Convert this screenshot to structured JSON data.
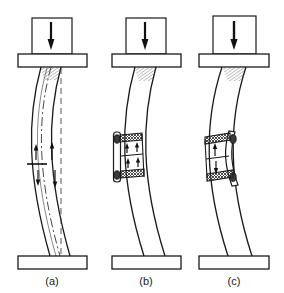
{
  "figure": {
    "background_color": "#ffffff",
    "line_color": "#1a1a1a",
    "fill_color": "#ffffff",
    "hatch_color": "#555555",
    "panel_count": 3
  },
  "panels": [
    {
      "id": "a",
      "caption": "(a)",
      "description": "Buckled column under axial load, unrepaired",
      "load_arrow": "down-arrow",
      "load_block": "load-block",
      "top_plate": "top-base-plate",
      "bottom_plate": "bottom-base-plate",
      "weld_hatch_top": true,
      "centerline_curved": true,
      "centerline_straight_dashed": true,
      "splice_plate": false,
      "arrows": [
        {
          "id": "a-arrow-1",
          "direction": "up",
          "side": "left",
          "row": "upper"
        },
        {
          "id": "a-arrow-2",
          "direction": "up",
          "side": "right",
          "row": "upper"
        },
        {
          "id": "a-arrow-3",
          "direction": "down",
          "side": "left",
          "row": "lower"
        },
        {
          "id": "a-arrow-4",
          "direction": "down",
          "side": "right",
          "row": "lower"
        }
      ],
      "section_tick": true,
      "arrow_count": 4
    },
    {
      "id": "b",
      "caption": "(b)",
      "description": "Symmetric splice plate with bolts on concave side, two welded bands",
      "load_arrow": "down-arrow",
      "load_block": "load-block",
      "top_plate": "top-base-plate",
      "bottom_plate": "bottom-base-plate",
      "weld_hatch_top": true,
      "centerline_curved": false,
      "centerline_straight_dashed": false,
      "splice_plate": true,
      "splice_plate_side": "left",
      "weld_bands": 2,
      "bolts": 2,
      "arrows": [
        {
          "id": "b-arrow-1",
          "direction": "up",
          "side": "left",
          "row": "upper"
        },
        {
          "id": "b-arrow-2",
          "direction": "up",
          "side": "right",
          "row": "upper"
        },
        {
          "id": "b-arrow-3",
          "direction": "up",
          "side": "left",
          "row": "lower"
        },
        {
          "id": "b-arrow-4",
          "direction": "up",
          "side": "right",
          "row": "lower"
        }
      ],
      "section_tick": false,
      "arrow_count": 4
    },
    {
      "id": "c",
      "caption": "(c)",
      "description": "Single-side reinforcement plate on convex side, two welded bands",
      "load_arrow": "down-arrow",
      "load_block": "load-block",
      "top_plate": "top-base-plate",
      "bottom_plate": "bottom-base-plate",
      "weld_hatch_top": true,
      "centerline_curved": false,
      "centerline_straight_dashed": false,
      "splice_plate": true,
      "splice_plate_side": "right",
      "weld_bands": 2,
      "bolts": 2,
      "arrows": [
        {
          "id": "c-arrow-1",
          "direction": "up",
          "side": "center",
          "row": "upper"
        },
        {
          "id": "c-arrow-2",
          "direction": "down",
          "side": "center",
          "row": "lower"
        }
      ],
      "section_tick": false,
      "arrow_count": 2
    }
  ]
}
